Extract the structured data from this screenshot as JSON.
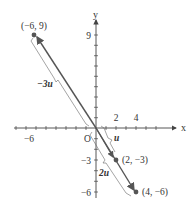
{
  "diagram": {
    "type": "vector-scalar-multiples",
    "axes": {
      "x_label": "x",
      "y_label": "y",
      "origin_label": "O",
      "x_ticks_labeled": [
        "-6",
        "2",
        "4"
      ],
      "y_ticks_labeled": [
        "9",
        "-3",
        "-6"
      ]
    },
    "points": [
      {
        "label": "(-6, 9)",
        "x": -6,
        "y": 9
      },
      {
        "label": "(2, -3)",
        "x": 2,
        "y": -3
      },
      {
        "label": "(4, -6)",
        "x": 4,
        "y": -6
      }
    ],
    "vectors": [
      {
        "label": "u",
        "from": [
          0,
          0
        ],
        "to": [
          2,
          -3
        ]
      },
      {
        "label": "2u",
        "from": [
          0,
          0
        ],
        "to": [
          4,
          -6
        ]
      },
      {
        "label": "-3u",
        "from": [
          0,
          0
        ],
        "to": [
          -6,
          9
        ]
      }
    ],
    "labels": {
      "vec_u": "u",
      "vec_2u": "2u",
      "vec_neg3u": "−3u",
      "pt_a": "(−6, 9)",
      "pt_b": "(2, −3)",
      "pt_c": "(4, −6)",
      "tick_x_neg6": "−6",
      "tick_x_2": "2",
      "tick_x_4": "4",
      "tick_y_9": "9",
      "tick_y_neg3": "−3",
      "tick_y_neg6": "−6"
    },
    "colors": {
      "axis": "#444444",
      "vector": "#555555",
      "point": "#555555",
      "text": "#333333"
    }
  }
}
